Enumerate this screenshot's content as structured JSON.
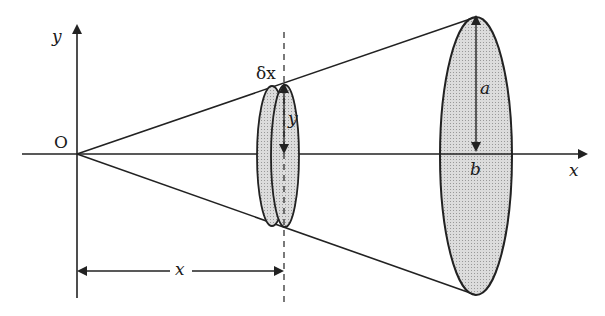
{
  "figure": {
    "labels": {
      "origin": "O",
      "y_axis": "y",
      "x_axis": "x",
      "slice_thickness": "δx",
      "slice_radius": "y",
      "cone_radius": "a",
      "cone_height": "b",
      "distance": "x"
    },
    "colors": {
      "stroke": "#222222",
      "fill": "#d4d4d4",
      "background": "#ffffff"
    }
  }
}
